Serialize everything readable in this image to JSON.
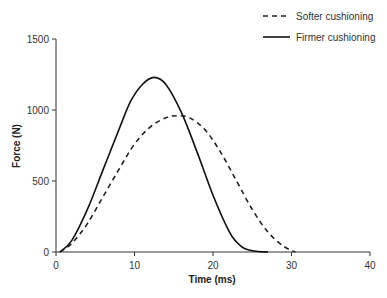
{
  "chart_data": {
    "type": "line",
    "title": "",
    "xlabel": "Time (ms)",
    "ylabel": "Force (N)",
    "xlim": [
      0,
      40
    ],
    "ylim": [
      0,
      1500
    ],
    "xticks": [
      "0",
      "10",
      "20",
      "30",
      "40"
    ],
    "yticks": [
      "0",
      "500",
      "1000",
      "1500"
    ],
    "grid": false,
    "legend_position": "top-right",
    "series": [
      {
        "name": "Softer cushioning",
        "style": "dashed",
        "x": [
          0.5,
          2,
          4,
          6,
          8,
          10,
          12,
          14,
          15.5,
          17,
          19,
          21,
          23,
          25,
          27,
          29,
          30.5
        ],
        "y": [
          0,
          60,
          200,
          390,
          580,
          760,
          880,
          945,
          960,
          945,
          860,
          700,
          500,
          300,
          140,
          40,
          0
        ]
      },
      {
        "name": "Firmer cushioning",
        "style": "solid",
        "x": [
          0.5,
          2,
          4,
          6,
          8,
          9.5,
          11,
          12.5,
          14,
          16,
          18,
          20,
          22,
          23,
          24,
          25.5,
          27
        ],
        "y": [
          0,
          80,
          300,
          580,
          860,
          1060,
          1180,
          1230,
          1180,
          980,
          700,
          400,
          150,
          70,
          25,
          5,
          0
        ]
      }
    ]
  },
  "legend": {
    "items": [
      {
        "label": "Softer cushioning"
      },
      {
        "label": "Firmer cushioning"
      }
    ]
  },
  "axes": {
    "xlabel": "Time (ms)",
    "ylabel": "Force (N)",
    "xticks": [
      "0",
      "10",
      "20",
      "30",
      "40"
    ],
    "yticks": [
      "0",
      "500",
      "1000",
      "1500"
    ]
  }
}
